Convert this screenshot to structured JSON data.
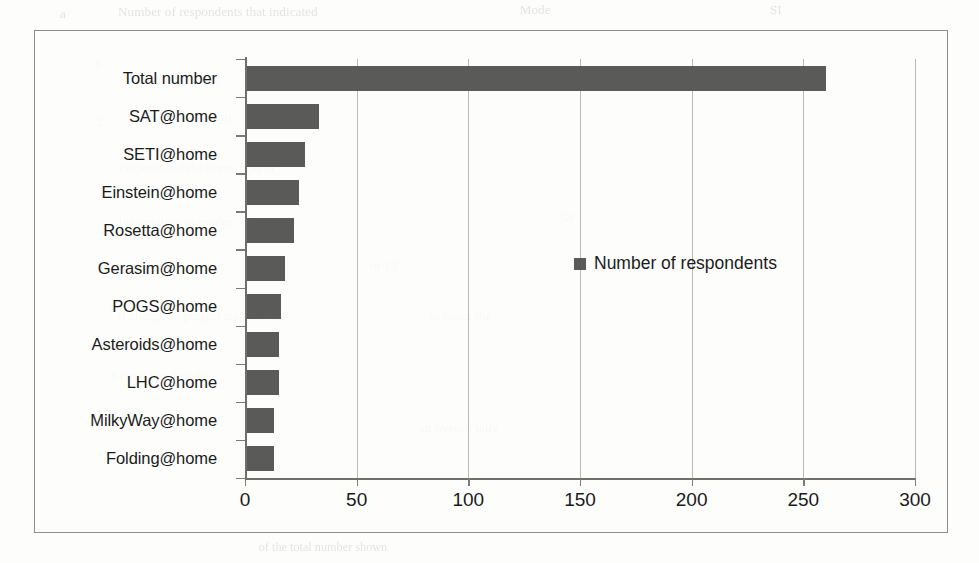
{
  "figure": {
    "background_color": "#fdfdfb",
    "frame_color": "#8d8d8a"
  },
  "chart_data": {
    "type": "bar",
    "orientation": "horizontal",
    "title": "",
    "xlabel": "",
    "ylabel": "",
    "categories": [
      "Total number",
      "SAT@home",
      "SETI@home",
      "Einstein@home",
      "Rosetta@home",
      "Gerasim@home",
      "POGS@home",
      "Asteroids@home",
      "LHC@home",
      "MilkyWay@home",
      "Folding@home"
    ],
    "values": [
      260,
      33,
      27,
      24,
      22,
      18,
      16,
      15,
      15,
      13,
      13
    ],
    "series": [
      {
        "name": "Number of respondents",
        "color": "#5a5a58",
        "values": [
          260,
          33,
          27,
          24,
          22,
          18,
          16,
          15,
          15,
          13,
          13
        ]
      }
    ],
    "xlim": [
      0,
      300
    ],
    "xticks": [
      0,
      50,
      100,
      150,
      200,
      250,
      300
    ],
    "xtick_labels": [
      "0",
      "50",
      "100",
      "150",
      "200",
      "250",
      "300"
    ],
    "grid": "vertical",
    "legend": {
      "position": "inside-middle-right",
      "entries": [
        {
          "label": "Number of respondents",
          "color": "#5a5a58"
        }
      ]
    }
  },
  "bleed_through": [
    {
      "text": "a",
      "x": 60,
      "y": 6,
      "size": 13
    },
    {
      "text": "Number of respondents that indicated",
      "x": 120,
      "y": 4,
      "size": 13
    },
    {
      "text": "Mode",
      "x": 520,
      "y": 2,
      "size": 13
    },
    {
      "text": "SI",
      "x": 770,
      "y": 2,
      "size": 13
    },
    {
      "text": "b",
      "x": 96,
      "y": 58,
      "size": 12
    },
    {
      "text": "Project Sponsored",
      "x": 128,
      "y": 112,
      "size": 14
    },
    {
      "text": "2",
      "x": 96,
      "y": 114,
      "size": 13
    },
    {
      "text": "Projects  and  the  home  grid  of",
      "x": 120,
      "y": 160,
      "size": 13
    },
    {
      "text": "Information in modes, values and",
      "x": 120,
      "y": 214,
      "size": 13
    },
    {
      "text": "58",
      "x": 560,
      "y": 210,
      "size": 13
    },
    {
      "text": "of 10",
      "x": 370,
      "y": 258,
      "size": 13
    },
    {
      "text": "it change to project respondents",
      "x": 120,
      "y": 308,
      "size": 13
    },
    {
      "text": "to make the",
      "x": 430,
      "y": 308,
      "size": 13
    },
    {
      "text": "3  Final  number  the",
      "x": 110,
      "y": 368,
      "size": 13
    },
    {
      "text": "an overall tally",
      "x": 420,
      "y": 420,
      "size": 13
    },
    {
      "text": "of the total number shown",
      "x": 260,
      "y": 540,
      "size": 12
    }
  ]
}
